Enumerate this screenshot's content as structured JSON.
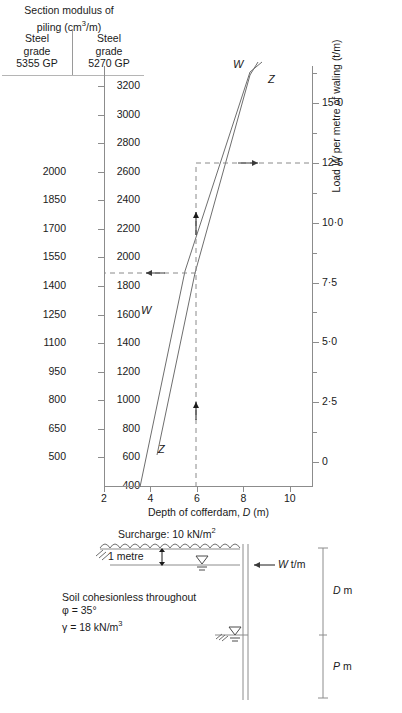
{
  "header": {
    "col_left": "Steel grade 5355 GP",
    "col_left_l1": "Steel",
    "col_left_l2": "grade",
    "col_left_l3": "5355 GP",
    "col_right_l1": "Steel",
    "col_right_l2": "grade",
    "col_right_l3": "5270 GP"
  },
  "chart_data": {
    "type": "line",
    "xlabel": "Depth of cofferdam, D (m)",
    "ylabel_right": "Load W per metre of waling (t/m)",
    "xlim": [
      2,
      11
    ],
    "xticks": [
      2,
      4,
      6,
      8,
      10
    ],
    "grid": false,
    "legend": "inline-curve-labels",
    "axis_left_5355": {
      "name": "Steel grade 5355 GP section modulus (cm³/m)",
      "ticks": [
        2000,
        1850,
        1700,
        1550,
        1400,
        1250,
        1100,
        950,
        800,
        650,
        500
      ],
      "tick_y_values": [
        2600,
        2400,
        2200,
        2000,
        1800,
        1600,
        1400,
        1200,
        1000,
        800,
        600
      ]
    },
    "axis_left_5270": {
      "name": "Steel grade 5270 GP section modulus (cm³/m)",
      "ticks": [
        3200,
        3000,
        2800,
        2600,
        2400,
        2200,
        2000,
        1800,
        1600,
        1400,
        1200,
        1000,
        800,
        600,
        400
      ],
      "range": [
        400,
        3200
      ]
    },
    "axis_right_load": {
      "name": "Load W per metre of waling (t/m)",
      "ticks": [
        "0",
        "2·5",
        "5·0",
        "7·5",
        "10·0",
        "12·5",
        "15·0"
      ],
      "tick_values": [
        0,
        2.5,
        5.0,
        7.5,
        10.0,
        12.5,
        15.0
      ],
      "minor_ticks": [
        1.25,
        3.75,
        6.25,
        8.75,
        11.25,
        13.75,
        16.25
      ],
      "range": [
        -0.6,
        16.5
      ]
    },
    "series": [
      {
        "name": "W",
        "label": "W",
        "description": "Load W per metre of waling versus depth of cofferdam",
        "x": [
          3.62,
          6.0,
          7.35
        ],
        "y_load": [
          3.6,
          12.5,
          17.6
        ],
        "label_top": "W",
        "label_bottom": "W"
      },
      {
        "name": "Z",
        "label": "Z",
        "description": "Section modulus Z of piling versus depth of cofferdam",
        "x": [
          4.3,
          6.0,
          7.9
        ],
        "y_modulus_5270": [
          680,
          2000,
          3530
        ],
        "label_top": "Z",
        "label_bottom": "Z"
      }
    ],
    "construction_lines": [
      {
        "name": "vertical-at-D6",
        "type": "vertical-dashed",
        "x": 6.0,
        "from_y": 0,
        "to_y": 12.5,
        "arrows": "up"
      },
      {
        "name": "load-readoff",
        "type": "horizontal-dashed-right",
        "y_load": 12.5,
        "from_x": 6.0,
        "to_x": 11.0,
        "arrow": "right"
      },
      {
        "name": "modulus-readoff",
        "type": "horizontal-dashed-left",
        "y_modulus_5270": 2000,
        "y_modulus_5355": 1550,
        "from_x": 6.0,
        "to_x": 2.0,
        "arrow": "left"
      }
    ]
  },
  "diagram": {
    "surcharge": "Surcharge: 10 kN/m²",
    "surcharge_value": "10 kN/m²",
    "one_metre": "1 metre",
    "load_label": "W t/m",
    "soil_note": "Soil cohesionless throughout",
    "phi": "φ = 35°",
    "gamma": "γ = 18 kN/m³",
    "dim_upper": "D m",
    "dim_lower": "P m"
  },
  "colors": {
    "ink": "#1a1a1a",
    "axis": "#8c8c8c",
    "curve": "#6e6e6e",
    "dashed": "#6e6e6e"
  }
}
